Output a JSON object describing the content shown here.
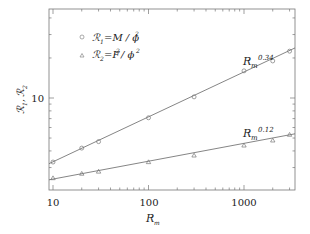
{
  "chart_data": {
    "type": "scatter",
    "title": "",
    "xlabel": "R_m",
    "ylabel": "R1, R2",
    "xscale": "log",
    "yscale": "log",
    "xlim": [
      9,
      3500
    ],
    "ylim": [
      2.3,
      45
    ],
    "x_ticks": [
      10,
      100,
      1000
    ],
    "x_tick_labels": [
      "10",
      "100",
      "1000"
    ],
    "y_ticks": [
      10
    ],
    "y_tick_labels": [
      "10"
    ],
    "grid": false,
    "legend_position": "upper left",
    "x": [
      10,
      20,
      30,
      100,
      300,
      1000,
      2000,
      3000
    ],
    "series": [
      {
        "name": "R1 = M/φ²",
        "marker": "circle",
        "values": [
          3.3,
          4.2,
          4.7,
          7.1,
          10.2,
          16.0,
          19.0,
          22.5
        ],
        "fit": {
          "label": "Rm^0.34",
          "exponent": 0.34,
          "y_at_10": 3.3,
          "y_at_3000": 22.8
        }
      },
      {
        "name": "R2 = F²/φ²",
        "marker": "triangle",
        "values": [
          2.5,
          2.7,
          2.8,
          3.3,
          3.7,
          4.4,
          4.8,
          5.3
        ],
        "fit": {
          "label": "Rm^0.12",
          "exponent": 0.12,
          "y_at_10": 2.45,
          "y_at_3000": 5.3
        }
      }
    ],
    "annotations": [
      {
        "text": "Rm^0.34",
        "near_series": 0
      },
      {
        "text": "Rm^0.12",
        "near_series": 1
      }
    ]
  },
  "labels": {
    "x_axis_main": "R",
    "x_axis_sub": "m",
    "y_axis_r": "ℛ",
    "y_axis_sub1": "1",
    "y_axis_sep": ",",
    "y_axis_sub2": "2",
    "tick_x_10": "10",
    "tick_x_100": "100",
    "tick_x_1000": "1000",
    "tick_y_10": "10",
    "legend1_sym": "ℛ",
    "legend1_sub": "1",
    "legend1_eq": "=M / ϕ",
    "legend1_sup": "2",
    "legend2_sym": "ℛ",
    "legend2_sub": "2",
    "legend2_eq_a": "=F",
    "legend2_sup_a": "2",
    "legend2_eq_b": "/ ϕ",
    "legend2_sup_b": "2",
    "ann1_main": "R",
    "ann1_sub": "m",
    "ann1_sup": "0.34",
    "ann2_main": "R",
    "ann2_sub": "m",
    "ann2_sup": "0.12"
  },
  "colors": {
    "axis": "#555555",
    "line": "#666666",
    "marker": "#777777",
    "text": "#222222"
  }
}
